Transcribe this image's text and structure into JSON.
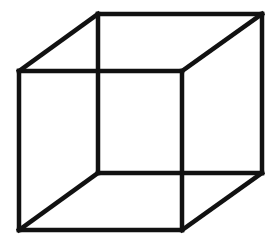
{
  "diagram": {
    "type": "wireframe-cube",
    "background": "#ffffff",
    "stroke_color": "#111111",
    "stroke_width": 4.5,
    "vertices": {
      "back_top_left": [
        98,
        14
      ],
      "back_top_right": [
        262,
        14
      ],
      "back_bottom_right": [
        262,
        173
      ],
      "back_bottom_left": [
        98,
        173
      ],
      "front_top_left": [
        19,
        71
      ],
      "front_top_right": [
        182,
        71
      ],
      "front_bottom_right": [
        182,
        230
      ],
      "front_bottom_left": [
        19,
        230
      ]
    },
    "edges": [
      [
        "back_top_left",
        "back_top_right"
      ],
      [
        "back_top_right",
        "back_bottom_right"
      ],
      [
        "back_bottom_right",
        "back_bottom_left"
      ],
      [
        "back_bottom_left",
        "back_top_left"
      ],
      [
        "front_top_left",
        "front_top_right"
      ],
      [
        "front_top_right",
        "front_bottom_right"
      ],
      [
        "front_bottom_right",
        "front_bottom_left"
      ],
      [
        "front_bottom_left",
        "front_top_left"
      ],
      [
        "front_top_left",
        "back_top_left"
      ],
      [
        "front_top_right",
        "back_top_right"
      ],
      [
        "front_bottom_right",
        "back_bottom_right"
      ],
      [
        "front_bottom_left",
        "back_bottom_left"
      ]
    ]
  }
}
